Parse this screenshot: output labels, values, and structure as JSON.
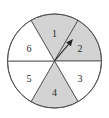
{
  "diagram": {
    "type": "spinner",
    "center": [
      54.5,
      61
    ],
    "radius": 47,
    "colors": {
      "shaded": "#d3d3d3",
      "unshaded": "#ffffff",
      "stroke": "#555555",
      "arrow": "#222222"
    },
    "sectors": [
      {
        "label": "1",
        "shaded": true,
        "start_deg": -120,
        "end_deg": -60,
        "label_pos": [
          54.5,
          33
        ]
      },
      {
        "label": "2",
        "shaded": true,
        "start_deg": -60,
        "end_deg": 0,
        "label_pos": [
          80,
          48
        ]
      },
      {
        "label": "3",
        "shaded": false,
        "start_deg": 0,
        "end_deg": 60,
        "label_pos": [
          80,
          78
        ]
      },
      {
        "label": "4",
        "shaded": true,
        "start_deg": 60,
        "end_deg": 120,
        "label_pos": [
          54.5,
          92
        ]
      },
      {
        "label": "5",
        "shaded": false,
        "start_deg": 120,
        "end_deg": 180,
        "label_pos": [
          29,
          78
        ]
      },
      {
        "label": "6",
        "shaded": false,
        "start_deg": 180,
        "end_deg": 240,
        "label_pos": [
          29,
          48
        ]
      }
    ],
    "arrow": {
      "from": [
        54.5,
        61
      ],
      "to": [
        73,
        39
      ]
    }
  }
}
